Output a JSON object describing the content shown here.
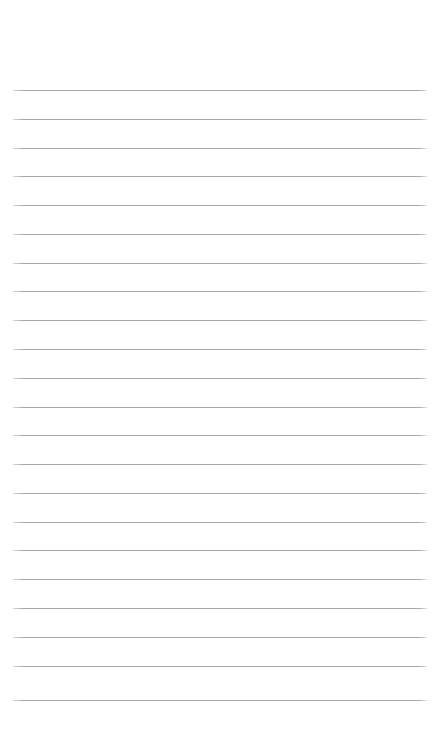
{
  "page": {
    "background_color": "#ffffff",
    "width_px": 434,
    "height_px": 746
  },
  "header_area": {
    "label": "",
    "height_px": 88,
    "content": ""
  },
  "footer_area": {
    "label": "",
    "height_px": 42,
    "content": ""
  },
  "ruled_lines": {
    "count": 22,
    "color": "#a9a9ad",
    "thickness_px": 1,
    "left_margin_px": 13,
    "right_margin_px": 7,
    "line_length_px": 414,
    "first_line_y_px": 90,
    "last_line_y_px": 700,
    "spacing_px": 29,
    "y_positions": [
      90,
      119,
      148,
      176,
      205,
      234,
      263,
      291,
      320,
      349,
      378,
      407,
      435,
      464,
      493,
      522,
      550,
      579,
      608,
      637,
      666,
      700
    ]
  }
}
